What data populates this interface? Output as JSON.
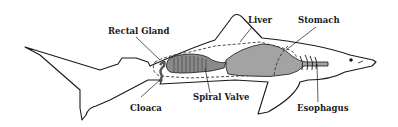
{
  "diagram": {
    "labels": [
      {
        "id": "rectal-gland",
        "text": "Rectal Gland"
      },
      {
        "id": "liver",
        "text": "Liver"
      },
      {
        "id": "stomach",
        "text": "Stomach"
      },
      {
        "id": "cloaca",
        "text": "Cloaca"
      },
      {
        "id": "spiral-valve",
        "text": "Spiral Valve"
      },
      {
        "id": "esophagus",
        "text": "Esophagus"
      }
    ],
    "colors": {
      "outline": "#1a1a1a",
      "organ_fill": "#9a9a9a",
      "organ_dark": "#6e6e6e",
      "background": "#ffffff"
    }
  }
}
